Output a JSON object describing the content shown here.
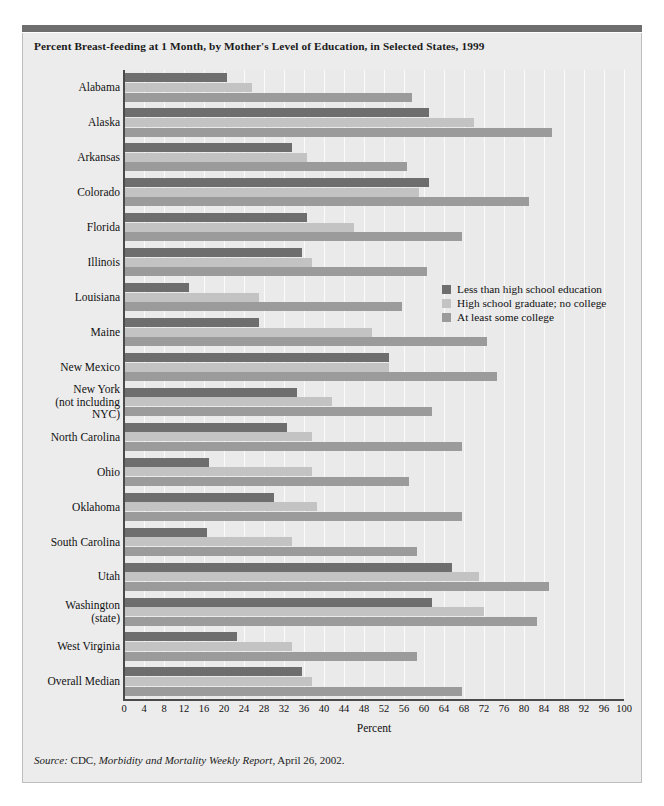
{
  "title": "Percent Breast-feeding at 1 Month, by Mother's Level of Education, in Selected States, 1999",
  "source": {
    "prefix": "Source:",
    "agency": " CDC, ",
    "publication": "Morbidity and Mortality Weekly Report",
    "suffix": ", April 26, 2002."
  },
  "colors": {
    "series_less_than_hs": "#6e6e6e",
    "series_hs_grad": "#c3c3c3",
    "series_some_college": "#9b9b9b",
    "panel_background": "#ececec",
    "plot_background": "#eaeaea",
    "gridline": "#fbfbfb",
    "axis": "#4a4a4a",
    "top_rule": "#6e6e6e"
  },
  "chart_data": {
    "type": "bar",
    "orientation": "horizontal",
    "title": "Percent Breast-feeding at 1 Month, by Mother's Level of Education, in Selected States, 1999",
    "xlabel": "Percent",
    "ylabel": "",
    "xlim": [
      0,
      100
    ],
    "xticks": [
      0,
      4,
      8,
      12,
      16,
      20,
      24,
      28,
      32,
      36,
      40,
      44,
      48,
      52,
      56,
      60,
      64,
      68,
      72,
      76,
      80,
      84,
      88,
      92,
      96,
      100
    ],
    "grid": true,
    "legend_position": "middle-right",
    "categories": [
      "Alabama",
      "Alaska",
      "Arkansas",
      "Colorado",
      "Florida",
      "Illinois",
      "Louisiana",
      "Maine",
      "New Mexico",
      "New York\n(not including\nNYC)",
      "North Carolina",
      "Ohio",
      "Oklahoma",
      "South Carolina",
      "Utah",
      "Washington\n(state)",
      "West Virginia",
      "Overall Median"
    ],
    "series": [
      {
        "name": "Less than high school education",
        "color": "#6e6e6e",
        "values": [
          20.5,
          61,
          33.5,
          61,
          36.5,
          35.5,
          13,
          27,
          53,
          34.5,
          32.5,
          17,
          30,
          16.5,
          65.5,
          61.5,
          22.5,
          35.5
        ]
      },
      {
        "name": "High school graduate; no college",
        "color": "#c3c3c3",
        "values": [
          25.5,
          70,
          36.5,
          59,
          46,
          37.5,
          27,
          49.5,
          53,
          41.5,
          37.5,
          37.5,
          38.5,
          33.5,
          71,
          72,
          33.5,
          37.5
        ]
      },
      {
        "name": "At least some college",
        "color": "#9b9b9b",
        "values": [
          57.5,
          85.5,
          56.5,
          81,
          67.5,
          60.5,
          55.5,
          72.5,
          74.5,
          61.5,
          67.5,
          57,
          67.5,
          58.5,
          85,
          82.5,
          58.5,
          67.5
        ]
      }
    ]
  }
}
